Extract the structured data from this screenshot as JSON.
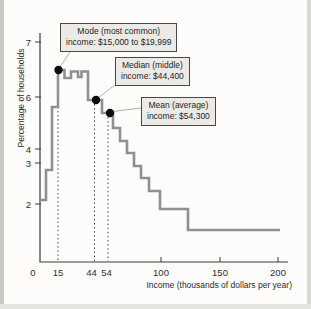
{
  "chart_data": {
    "type": "line",
    "subtype": "step-histogram-outline",
    "xlabel": "Income (thousands of dollars per year)",
    "ylabel": "Percentage of households",
    "grid": false,
    "line_color": "#909090",
    "axis_color": "#3a3a3a",
    "x_axis": {
      "units": "thousands of dollars per year",
      "range": [
        0,
        200
      ],
      "ticks": [
        {
          "label": "0",
          "x_px": 33,
          "tick_mark": false
        },
        {
          "label": "15",
          "x_px": 58,
          "tick_mark": false
        },
        {
          "label": "44",
          "x_px": 91.5,
          "tick_mark": false
        },
        {
          "label": "54",
          "x_px": 106.5,
          "tick_mark": false
        },
        {
          "label": "100",
          "x_px": 161,
          "tick_mark": true
        },
        {
          "label": "150",
          "x_px": 220,
          "tick_mark": true
        },
        {
          "label": "200",
          "x_px": 278,
          "tick_mark": true
        }
      ]
    },
    "y_axis": {
      "units": "percent of households",
      "ticks": [
        {
          "label": "7",
          "y_px": 42
        },
        {
          "label": "6",
          "y_px": 97
        },
        {
          "label": "4",
          "y_px": 149
        },
        {
          "label": "3",
          "y_px": 163
        },
        {
          "label": "2",
          "y_px": 204
        }
      ]
    },
    "bins": [
      {
        "range_thousands": "0-5",
        "pct": 2.1
      },
      {
        "range_thousands": "5-10",
        "pct": 2.9
      },
      {
        "range_thousands": "10-15",
        "pct": 5.7
      },
      {
        "range_thousands": "15-20",
        "pct": 6.5
      },
      {
        "range_thousands": "20-25",
        "pct": 6.3
      },
      {
        "range_thousands": "25-30",
        "pct": 6.45
      },
      {
        "range_thousands": "30-35",
        "pct": 6.35
      },
      {
        "range_thousands": "35-40",
        "pct": 6.45
      },
      {
        "range_thousands": "40-50",
        "pct": 6.0
      },
      {
        "range_thousands": "50-55",
        "pct": 5.5
      },
      {
        "range_thousands": "55-60",
        "pct": 5.0
      },
      {
        "range_thousands": "60-65",
        "pct": 4.4
      },
      {
        "range_thousands": "65-70",
        "pct": 4.0
      },
      {
        "range_thousands": "70-75",
        "pct": 3.5
      },
      {
        "range_thousands": "75-80",
        "pct": 3.0
      },
      {
        "range_thousands": "80-85",
        "pct": 2.7
      },
      {
        "range_thousands": "85-100",
        "pct": 2.3
      },
      {
        "range_thousands": "100-125",
        "pct": 1.9
      },
      {
        "range_thousands": "125-200",
        "pct": 1.4
      }
    ],
    "plateaus_px": [
      [
        40,
        46,
        200
      ],
      [
        46,
        52,
        170
      ],
      [
        52,
        58,
        107
      ],
      [
        58,
        64.5,
        70
      ],
      [
        64.5,
        71,
        78
      ],
      [
        71,
        78,
        71.5
      ],
      [
        78,
        81.5,
        77
      ],
      [
        81.5,
        88,
        71.5
      ],
      [
        88,
        102,
        100
      ],
      [
        102,
        113,
        113
      ],
      [
        113,
        120,
        128
      ],
      [
        120,
        127,
        141
      ],
      [
        127,
        134,
        153
      ],
      [
        134,
        141,
        166
      ],
      [
        141,
        149,
        178
      ],
      [
        149,
        160,
        191
      ],
      [
        160,
        188,
        209
      ],
      [
        188,
        280,
        230
      ]
    ],
    "annotations": [
      {
        "name": "mode",
        "lines": [
          "Mode (most common)",
          "income: $15,000 to $19,999"
        ],
        "value": "$15,000 to $19,999",
        "box_px": {
          "x": 60,
          "y": 23
        },
        "dot_px": [
          58.5,
          70
        ],
        "leader_px": [
          [
            70,
            52
          ],
          [
            60,
            67
          ]
        ],
        "dotted_x_px": 58,
        "dotted_y1_px": 74
      },
      {
        "name": "median",
        "lines": [
          "Median (middle)",
          "income: $44,400"
        ],
        "value": "$44,400",
        "box_px": {
          "x": 115,
          "y": 57
        },
        "dot_px": [
          96,
          100
        ],
        "leader_px": [
          [
            116,
            84
          ],
          [
            98,
            98
          ]
        ],
        "dotted_x_px": 94.5,
        "dotted_y1_px": 104
      },
      {
        "name": "mean",
        "lines": [
          "Mean (average)",
          "income: $54,300"
        ],
        "value": "$54,300",
        "box_px": {
          "x": 141,
          "y": 97
        },
        "dot_px": [
          110,
          113
        ],
        "leader_px": [
          [
            141,
            108
          ],
          [
            113,
            111.5
          ]
        ],
        "dotted_x_px": 108,
        "dotted_y1_px": 117
      }
    ],
    "axis_geometry_px": {
      "x0": 40,
      "y_top": 33,
      "y_bottom": 262,
      "x_right": 288
    }
  }
}
